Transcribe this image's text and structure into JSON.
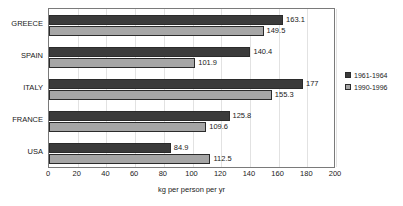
{
  "chart_data": {
    "type": "bar",
    "orientation": "horizontal",
    "title": "",
    "xlabel": "kg per person per yr",
    "ylabel": "",
    "xlim": [
      0,
      200
    ],
    "xticks": [
      0,
      20,
      40,
      60,
      80,
      100,
      120,
      140,
      160,
      180,
      200
    ],
    "grid": true,
    "legend_position": "right",
    "categories": [
      "GREECE",
      "SPAIN",
      "ITALY",
      "FRANCE",
      "USA"
    ],
    "series": [
      {
        "name": "1961-1964",
        "color": "#3b3b3b",
        "values": [
          163.1,
          140.4,
          177,
          125.8,
          84.9
        ],
        "labels": [
          "163.1",
          "140.4",
          "177",
          "125.8",
          "84.9"
        ]
      },
      {
        "name": "1990-1996",
        "color": "#a6a6a6",
        "values": [
          149.5,
          101.9,
          155.3,
          109.6,
          112.5
        ],
        "labels": [
          "149.5",
          "101.9",
          "155.3",
          "109.6",
          "112.5"
        ]
      }
    ]
  },
  "legend": {
    "items": [
      {
        "label": "1961-1964"
      },
      {
        "label": "1990-1996"
      }
    ]
  },
  "axis": {
    "x_title": "kg per person per yr",
    "x_tick_labels": [
      "0",
      "20",
      "40",
      "60",
      "80",
      "100",
      "120",
      "140",
      "160",
      "180",
      "200"
    ]
  },
  "colors": {
    "series_1961_1964": "#3b3b3b",
    "series_1990_1996": "#a6a6a6",
    "plot_border": "#7a7a7a",
    "gridline": "#e2e2e2",
    "text": "#1a1a1a",
    "background": "#ffffff"
  }
}
